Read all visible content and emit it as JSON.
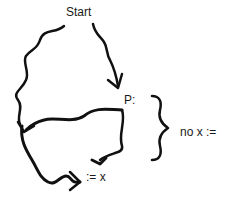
{
  "diagram": {
    "type": "flowchart-hand-drawn",
    "nodes": {
      "start": "Start",
      "p": "P:",
      "assign": ":= x",
      "no_assign": "no x :="
    },
    "edges": [
      {
        "from": "Start",
        "to": "P:",
        "style": "wavy-arrow"
      },
      {
        "from": "Start",
        "to": "merge-left",
        "style": "wavy-line"
      },
      {
        "from": "P:",
        "to": "merge-left",
        "style": "wavy-arrow"
      },
      {
        "from": "P:",
        "to": ":= x",
        "style": "wavy-arrow"
      },
      {
        "from": "merge-left",
        "to": ":= x",
        "style": "wavy-arrow"
      }
    ],
    "brace": {
      "label": "no x :=",
      "spans": "P: to := x"
    },
    "colors": {
      "stroke": "#111111",
      "background": "#ffffff",
      "text": "#1a1a1a"
    }
  }
}
